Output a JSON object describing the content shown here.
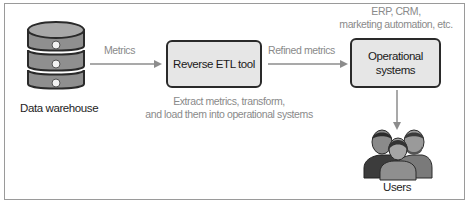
{
  "diagram": {
    "source": {
      "label": "Data warehouse",
      "icon": "database-icon"
    },
    "edge_1": {
      "label": "Metrics"
    },
    "process": {
      "label": "Reverse ETL tool",
      "caption_line1": "Extract metrics, transform,",
      "caption_line2": "and load them into operational systems"
    },
    "edge_2": {
      "label": "Refined metrics"
    },
    "target": {
      "label_line1": "Operational",
      "label_line2": "systems",
      "examples_line1": "ERP, CRM,",
      "examples_line2": "marketing automation, etc."
    },
    "consumers": {
      "label": "Users",
      "icon": "users-group-icon"
    },
    "colors": {
      "box_fill": "#e6e6e6",
      "box_border": "#2a2a2a",
      "arrow": "#8c8c8c",
      "muted_text": "#8a8a8a",
      "dark_text": "#1e1e1e",
      "frame_border": "#9a9a9a"
    }
  }
}
